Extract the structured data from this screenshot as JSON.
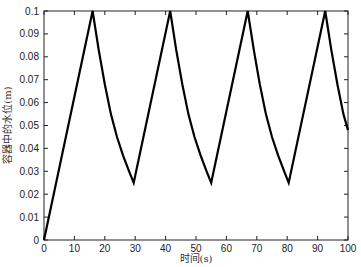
{
  "chart_data": {
    "type": "line",
    "title": "",
    "xlabel": "时间(s)",
    "ylabel": "容器中的水位(m)",
    "xlim": [
      0,
      100
    ],
    "ylim": [
      0,
      0.1
    ],
    "xticks": [
      0,
      10,
      20,
      30,
      40,
      50,
      60,
      70,
      80,
      90,
      100
    ],
    "yticks": [
      0,
      0.01,
      0.02,
      0.03,
      0.04,
      0.05,
      0.06,
      0.07,
      0.08,
      0.09,
      0.1
    ],
    "grid": false,
    "legend": null,
    "series": [
      {
        "name": "water level",
        "color": "#000000",
        "points": [
          [
            0,
            0
          ],
          [
            16,
            0.1
          ],
          [
            18,
            0.083
          ],
          [
            20,
            0.068
          ],
          [
            22,
            0.055
          ],
          [
            24,
            0.045
          ],
          [
            26,
            0.037
          ],
          [
            28,
            0.03
          ],
          [
            29.5,
            0.025
          ],
          [
            41.5,
            0.1
          ],
          [
            43.5,
            0.083
          ],
          [
            45.5,
            0.068
          ],
          [
            47.5,
            0.055
          ],
          [
            49.5,
            0.045
          ],
          [
            51.5,
            0.037
          ],
          [
            53.5,
            0.03
          ],
          [
            55,
            0.025
          ],
          [
            67,
            0.1
          ],
          [
            69,
            0.083
          ],
          [
            71,
            0.068
          ],
          [
            73,
            0.055
          ],
          [
            75,
            0.045
          ],
          [
            77,
            0.037
          ],
          [
            79,
            0.03
          ],
          [
            80.5,
            0.025
          ],
          [
            92.5,
            0.1
          ],
          [
            94.5,
            0.083
          ],
          [
            96.5,
            0.068
          ],
          [
            98.5,
            0.055
          ],
          [
            100,
            0.048
          ]
        ]
      }
    ]
  }
}
